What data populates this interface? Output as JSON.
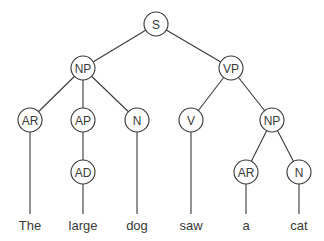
{
  "diagram": {
    "type": "parse-tree",
    "sentence": "The large dog saw a cat",
    "nodes": [
      {
        "id": "S",
        "label": "S",
        "x": 156,
        "y": 24
      },
      {
        "id": "NP1",
        "label": "NP",
        "x": 83,
        "y": 68
      },
      {
        "id": "VP",
        "label": "VP",
        "x": 231,
        "y": 68
      },
      {
        "id": "AR1",
        "label": "AR",
        "x": 30,
        "y": 120
      },
      {
        "id": "AP",
        "label": "AP",
        "x": 83,
        "y": 120
      },
      {
        "id": "N1",
        "label": "N",
        "x": 137,
        "y": 120
      },
      {
        "id": "V",
        "label": "V",
        "x": 191,
        "y": 120
      },
      {
        "id": "NP2",
        "label": "NP",
        "x": 272,
        "y": 120
      },
      {
        "id": "AD",
        "label": "AD",
        "x": 83,
        "y": 172
      },
      {
        "id": "AR2",
        "label": "AR",
        "x": 246,
        "y": 172
      },
      {
        "id": "N2",
        "label": "N",
        "x": 299,
        "y": 172
      }
    ],
    "edges": [
      [
        "S",
        "NP1"
      ],
      [
        "S",
        "VP"
      ],
      [
        "NP1",
        "AR1"
      ],
      [
        "NP1",
        "AP"
      ],
      [
        "NP1",
        "N1"
      ],
      [
        "AP",
        "AD"
      ],
      [
        "VP",
        "V"
      ],
      [
        "VP",
        "NP2"
      ],
      [
        "NP2",
        "AR2"
      ],
      [
        "NP2",
        "N2"
      ]
    ],
    "words": [
      {
        "text": "The",
        "x": 30,
        "parent": "AR1"
      },
      {
        "text": "large",
        "x": 83,
        "parent": "AD"
      },
      {
        "text": "dog",
        "x": 137,
        "parent": "N1"
      },
      {
        "text": "saw",
        "x": 191,
        "parent": "V"
      },
      {
        "text": "a",
        "x": 246,
        "parent": "AR2"
      },
      {
        "text": "cat",
        "x": 299,
        "parent": "N2"
      }
    ],
    "node_radius": 12,
    "word_line_end_y": 214,
    "word_baseline_y": 230,
    "colors": {
      "stroke": "#3a3a3a",
      "fill": "#ffffff",
      "text": "#3a3a3a"
    }
  }
}
